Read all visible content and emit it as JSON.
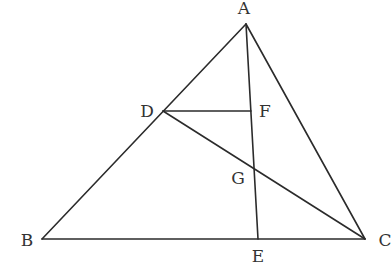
{
  "diagram": {
    "type": "geometry-triangle",
    "line_color": "#2b2b2b",
    "label_color": "#333333",
    "points": {
      "A": {
        "label": "A",
        "x": 246,
        "y": 24,
        "lx": 244,
        "ly": 14
      },
      "B": {
        "label": "B",
        "x": 42,
        "y": 239,
        "lx": 27,
        "ly": 246
      },
      "C": {
        "label": "C",
        "x": 365,
        "y": 239,
        "lx": 385,
        "ly": 246
      },
      "D": {
        "label": "D",
        "x": 163,
        "y": 111,
        "lx": 147,
        "ly": 117
      },
      "E": {
        "label": "E",
        "x": 258,
        "y": 239,
        "lx": 258,
        "ly": 262
      },
      "F": {
        "label": "F",
        "x": 251,
        "y": 111,
        "lx": 265,
        "ly": 117
      },
      "G": {
        "label": "G",
        "x": 255,
        "y": 167,
        "lx": 238,
        "ly": 184
      }
    },
    "segments": [
      [
        "A",
        "B"
      ],
      [
        "B",
        "C"
      ],
      [
        "A",
        "C"
      ],
      [
        "A",
        "E"
      ],
      [
        "D",
        "F"
      ],
      [
        "D",
        "C"
      ]
    ]
  }
}
